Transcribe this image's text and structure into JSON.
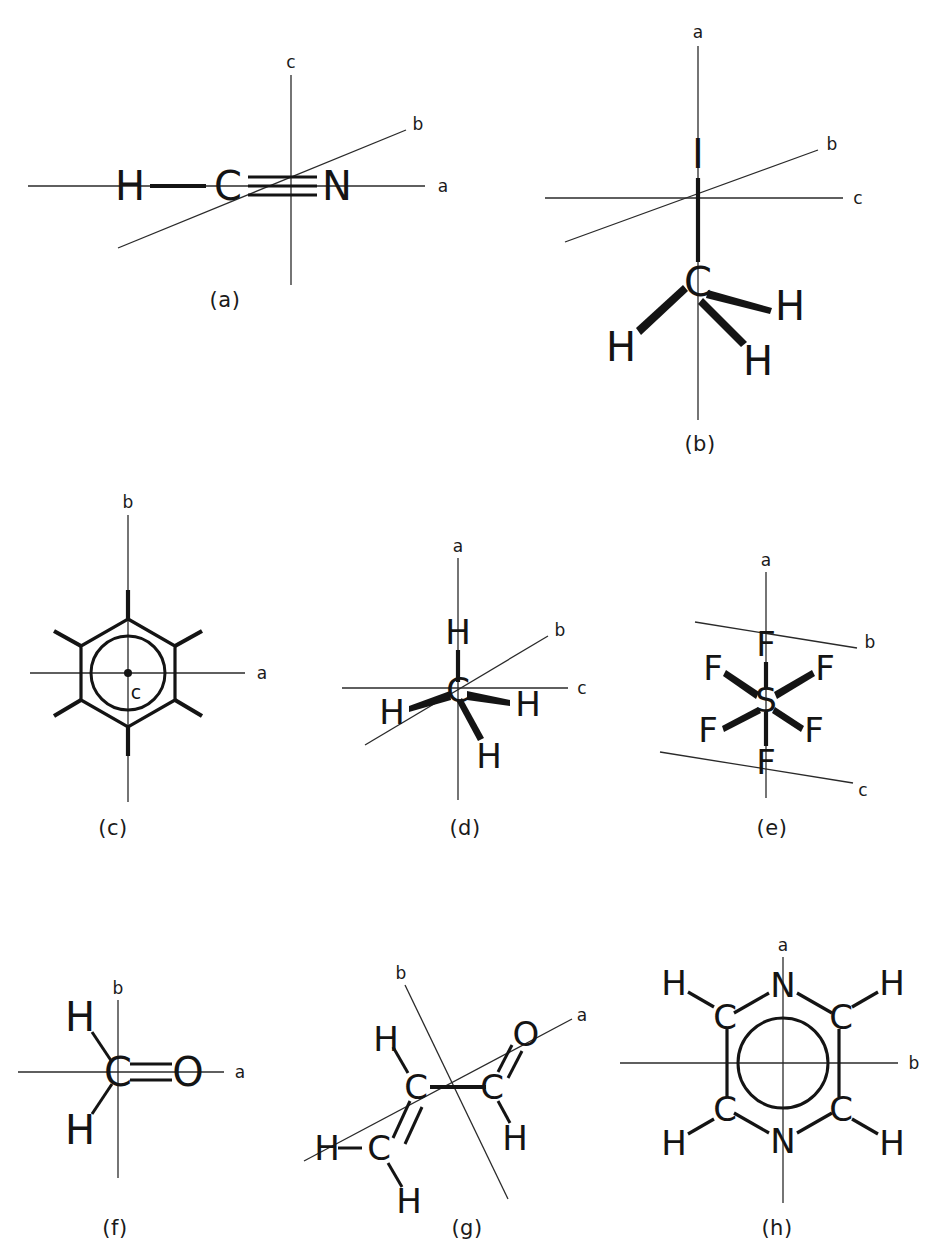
{
  "figure": {
    "background_color": "#ffffff",
    "ink_color": "#141414",
    "panel_count": 8
  },
  "panels": [
    {
      "id": "a",
      "caption": "(a)",
      "molecule": "HCN",
      "molecule_name": "hydrogen cyanide",
      "atoms": [
        "H",
        "C",
        "N"
      ],
      "bonds": [
        {
          "from": "H",
          "to": "C",
          "order": "single"
        },
        {
          "from": "C",
          "to": "N",
          "order": "triple"
        }
      ],
      "axes": [
        {
          "label": "a",
          "orientation": "horizontal"
        },
        {
          "label": "b",
          "orientation": "diagonal"
        },
        {
          "label": "c",
          "orientation": "vertical"
        }
      ]
    },
    {
      "id": "b",
      "caption": "(b)",
      "molecule": "CH3I",
      "molecule_name": "methyl iodide",
      "atoms": [
        "I",
        "C",
        "H",
        "H",
        "H"
      ],
      "bonds": [
        {
          "from": "I",
          "to": "C",
          "order": "single"
        },
        {
          "from": "C",
          "to": "H",
          "order": "wedge"
        },
        {
          "from": "C",
          "to": "H",
          "order": "wedge"
        },
        {
          "from": "C",
          "to": "H",
          "order": "wedge"
        }
      ],
      "axes": [
        {
          "label": "a",
          "orientation": "vertical"
        },
        {
          "label": "b",
          "orientation": "diagonal"
        },
        {
          "label": "c",
          "orientation": "horizontal"
        }
      ]
    },
    {
      "id": "c",
      "caption": "(c)",
      "molecule": "C6H6",
      "molecule_name": "benzene",
      "atoms": [
        "ring"
      ],
      "ring": {
        "vertices": 6,
        "inner_circle": true,
        "substituent_bonds": 6
      },
      "axes": [
        {
          "label": "a",
          "orientation": "horizontal"
        },
        {
          "label": "b",
          "orientation": "vertical"
        },
        {
          "label": "c",
          "orientation": "perpendicular-to-plane"
        }
      ]
    },
    {
      "id": "d",
      "caption": "(d)",
      "molecule": "CH4",
      "molecule_name": "methane",
      "atoms": [
        "C",
        "H",
        "H",
        "H",
        "H"
      ],
      "bonds": [
        {
          "from": "C",
          "to": "H",
          "order": "single"
        },
        {
          "from": "C",
          "to": "H",
          "order": "wedge"
        },
        {
          "from": "C",
          "to": "H",
          "order": "wedge"
        },
        {
          "from": "C",
          "to": "H",
          "order": "wedge"
        }
      ],
      "axes": [
        {
          "label": "a",
          "orientation": "vertical"
        },
        {
          "label": "b",
          "orientation": "diagonal"
        },
        {
          "label": "c",
          "orientation": "horizontal"
        }
      ]
    },
    {
      "id": "e",
      "caption": "(e)",
      "molecule": "SF6",
      "molecule_name": "sulfur hexafluoride",
      "atoms": [
        "S",
        "F",
        "F",
        "F",
        "F",
        "F",
        "F"
      ],
      "bonds": [
        {
          "from": "S",
          "to": "F",
          "order": "single"
        },
        {
          "from": "S",
          "to": "F",
          "order": "single"
        },
        {
          "from": "S",
          "to": "F",
          "order": "wedge"
        },
        {
          "from": "S",
          "to": "F",
          "order": "wedge"
        },
        {
          "from": "S",
          "to": "F",
          "order": "wedge"
        },
        {
          "from": "S",
          "to": "F",
          "order": "wedge"
        }
      ],
      "axes": [
        {
          "label": "a",
          "orientation": "vertical"
        },
        {
          "label": "b",
          "orientation": "diagonal-upper-right"
        },
        {
          "label": "c",
          "orientation": "diagonal-lower-right"
        }
      ]
    },
    {
      "id": "f",
      "caption": "(f)",
      "molecule": "H2CO",
      "molecule_name": "formaldehyde",
      "atoms": [
        "C",
        "O",
        "H",
        "H"
      ],
      "bonds": [
        {
          "from": "C",
          "to": "O",
          "order": "double"
        },
        {
          "from": "C",
          "to": "H",
          "order": "single"
        },
        {
          "from": "C",
          "to": "H",
          "order": "single"
        }
      ],
      "axes": [
        {
          "label": "a",
          "orientation": "horizontal"
        },
        {
          "label": "b",
          "orientation": "vertical"
        }
      ]
    },
    {
      "id": "g",
      "caption": "(g)",
      "molecule": "C3H4O",
      "molecule_name": "acrolein",
      "atoms": [
        "C",
        "C",
        "C",
        "O",
        "H",
        "H",
        "H",
        "H"
      ],
      "bonds": [
        {
          "from": "C",
          "to": "C",
          "order": "single"
        },
        {
          "from": "C",
          "to": "C",
          "order": "double"
        },
        {
          "from": "C",
          "to": "O",
          "order": "double"
        },
        {
          "from": "C",
          "to": "H",
          "order": "single"
        },
        {
          "from": "C",
          "to": "H",
          "order": "single"
        },
        {
          "from": "C",
          "to": "H",
          "order": "single"
        },
        {
          "from": "C",
          "to": "H",
          "order": "single"
        }
      ],
      "axes": [
        {
          "label": "a",
          "orientation": "diagonal-upper-right"
        },
        {
          "label": "b",
          "orientation": "diagonal-lower-right"
        }
      ]
    },
    {
      "id": "h",
      "caption": "(h)",
      "molecule": "C4H4N2",
      "molecule_name": "pyrazine",
      "atoms": [
        "N",
        "N",
        "C",
        "C",
        "C",
        "C",
        "H",
        "H",
        "H",
        "H"
      ],
      "ring": {
        "vertices": 6,
        "inner_circle": true
      },
      "axes": [
        {
          "label": "a",
          "orientation": "vertical"
        },
        {
          "label": "b",
          "orientation": "horizontal"
        }
      ]
    }
  ],
  "atom_labels": {
    "H": "H",
    "C": "C",
    "N": "N",
    "O": "O",
    "S": "S",
    "F": "F",
    "I": "I"
  },
  "axis_labels": {
    "a": "a",
    "b": "b",
    "c": "c"
  }
}
